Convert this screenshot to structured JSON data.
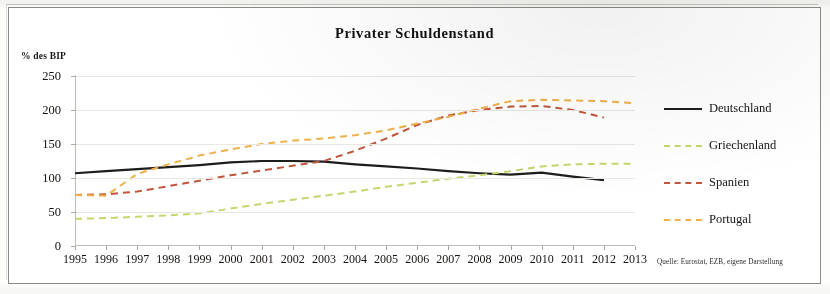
{
  "chart_data": {
    "type": "line",
    "title": "Privater Schuldenstand",
    "ylabel": "% des BIP",
    "xlabel": "",
    "source_note": "Quelle: Eurostat, EZB, eigene Darstellung",
    "ylim": [
      0,
      250
    ],
    "yticks": [
      0,
      50,
      100,
      150,
      200,
      250
    ],
    "grid": true,
    "legend_position": "right",
    "categories": [
      "1995",
      "1996",
      "1997",
      "1998",
      "1999",
      "2000",
      "2001",
      "2002",
      "2003",
      "2004",
      "2005",
      "2006",
      "2007",
      "2008",
      "2009",
      "2010",
      "2011",
      "2012",
      "2013"
    ],
    "series": [
      {
        "name": "Deutschland",
        "color": "#1d1d1b",
        "style": "solid",
        "values": [
          107,
          110,
          113,
          116,
          119,
          123,
          125,
          125,
          124,
          120,
          117,
          114,
          110,
          107,
          105,
          108,
          102,
          97,
          null
        ]
      },
      {
        "name": "Griechenland",
        "color": "#c6d66e",
        "style": "dashed",
        "values": [
          40,
          41,
          43,
          45,
          48,
          55,
          62,
          68,
          74,
          80,
          87,
          93,
          99,
          104,
          110,
          117,
          120,
          121,
          121
        ]
      },
      {
        "name": "Spanien",
        "color": "#c0553b",
        "style": "dashed",
        "values": [
          75,
          76,
          80,
          88,
          96,
          104,
          111,
          118,
          125,
          140,
          158,
          178,
          192,
          200,
          205,
          206,
          200,
          189,
          null
        ]
      },
      {
        "name": "Portugal",
        "color": "#f0b04a",
        "style": "dashed",
        "values": [
          75,
          74,
          106,
          120,
          133,
          142,
          150,
          155,
          158,
          163,
          170,
          180,
          190,
          202,
          213,
          215,
          214,
          213,
          210
        ]
      }
    ]
  }
}
